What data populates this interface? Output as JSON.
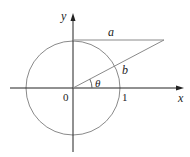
{
  "diagram": {
    "labels": {
      "y_axis": "y",
      "x_axis": "x",
      "origin": "0",
      "one": "1",
      "a": "a",
      "b": "b",
      "theta": "θ"
    },
    "geometry": {
      "circle": {
        "cx": 73,
        "cy": 88,
        "r": 47
      },
      "x_axis": {
        "x1": 10,
        "x2": 183,
        "y": 88
      },
      "y_axis": {
        "x": 73,
        "y1": 152,
        "y2": 14
      },
      "horizontal_segment": {
        "x1": 73,
        "x2": 164,
        "y": 40
      },
      "ray": {
        "x1": 73,
        "y1": 88,
        "x2": 164,
        "y2": 40
      }
    },
    "colors": {
      "axis": "#222222",
      "circle": "#888888",
      "lines": "#888888"
    }
  }
}
